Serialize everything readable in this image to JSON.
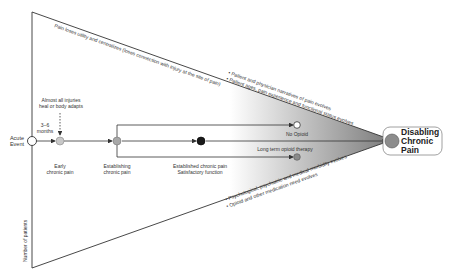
{
  "diagram": {
    "start_node": {
      "label_line1": "Acute",
      "label_line2": "Event"
    },
    "timing": {
      "line1": "3–6",
      "line2": "months"
    },
    "note_top": {
      "line1": "Almost all injuries",
      "line2": "heal or body adapts"
    },
    "stages": [
      {
        "id": "early",
        "line1": "Early",
        "line2": "chronic pain",
        "fill": "#c8c8c8"
      },
      {
        "id": "establishing",
        "line1": "Establishing",
        "line2": "chronic pain",
        "fill": "#a8a8a8"
      },
      {
        "id": "established",
        "line1": "Established chronic pain",
        "line2": "Satisfactory function",
        "fill": "#1a1a1a"
      }
    ],
    "branches": {
      "no_opioid": {
        "label": "No Opioid",
        "fill": "#ffffff"
      },
      "long_term_opioid": {
        "label": "Long term opioid therapy",
        "fill": "#8a8a8a"
      }
    },
    "end_node": {
      "line1": "Disabling",
      "line2": "Chronic",
      "line3": "Pain",
      "fill": "#8c8c8c"
    },
    "top_edge_text": "Pain loses utility and centralizes (loses connection with injury at the site of pain)",
    "upper_bullets": [
      "• Patient and physician narratives of pain evolves",
      "• Patient ages, pain experience and functional status evolves"
    ],
    "lower_bullets": [
      "• Psychological, psychiatric and medical morbidity evolves",
      "• Opioid and other medication need evolves"
    ],
    "y_axis_label": "Number of patients",
    "colors": {
      "line": "#333333",
      "gradient_start": "#ffffff",
      "gradient_end": "#8a8a8a"
    }
  }
}
